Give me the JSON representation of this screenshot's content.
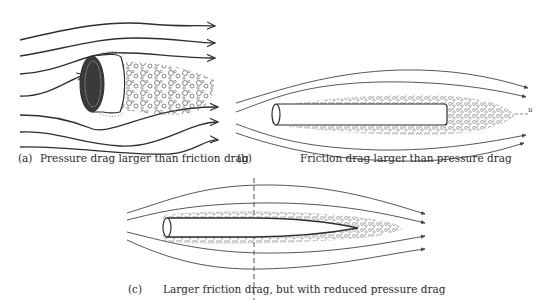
{
  "panels": [
    {
      "id": "a",
      "tag": "(a)",
      "caption": "Pressure drag larger than friction drag",
      "body": "blunt cylinder (bluff body) with large turbulent wake"
    },
    {
      "id": "b",
      "tag": "(b)",
      "caption": "Friction drag larger than pressure drag",
      "body": "long slender cylinder aligned with flow",
      "flow_label": "u"
    },
    {
      "id": "c",
      "tag": "(c)",
      "caption": "Larger friction drag, but with reduced pressure drag",
      "body": "streamlined tapered body"
    }
  ],
  "colors": {
    "stroke": "#2e2e2e",
    "wake": "#7a7a7a",
    "background": "#ffffff"
  }
}
